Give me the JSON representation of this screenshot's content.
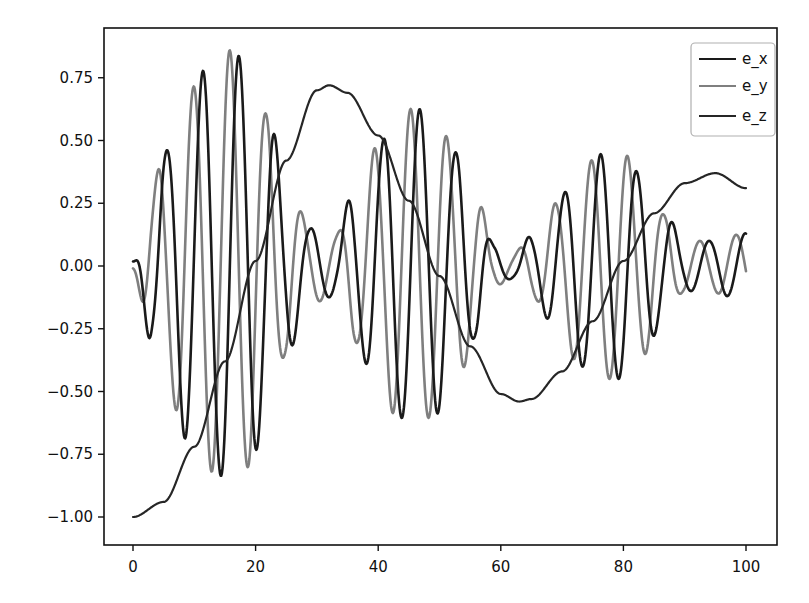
{
  "chart_data": {
    "type": "line",
    "title": "",
    "xlabel": "",
    "ylabel": "",
    "xlim": [
      -5,
      105
    ],
    "ylim": [
      -1.1,
      0.9
    ],
    "x_ticks": [
      0,
      20,
      40,
      60,
      80,
      100
    ],
    "x_tick_labels": [
      "0",
      "20",
      "40",
      "60",
      "80",
      "100"
    ],
    "y_ticks": [
      0.75,
      0.5,
      0.25,
      0.0,
      -0.25,
      -0.5,
      -0.75,
      -1.0
    ],
    "y_tick_labels": [
      "0.75",
      "0.50",
      "0.25",
      "0.00",
      "−0.25",
      "−0.50",
      "−0.75",
      "−1.00"
    ],
    "grid": false,
    "legend_position": "upper right",
    "colors": {
      "e_x": "#1a1a1a",
      "e_y": "#7f7f7f",
      "e_z": "#262626"
    },
    "series": [
      {
        "name": "e_x",
        "description": "fast oscillation (period ~5.9) with modulated envelope",
        "oscillation_period": 5.9,
        "phase_offset": 0.9,
        "envelope": {
          "t": [
            0,
            3,
            5,
            9,
            13,
            16,
            19,
            22,
            25,
            29,
            33,
            36,
            40,
            43,
            46,
            49,
            53,
            56,
            59,
            62,
            65,
            69,
            73,
            77,
            80,
            83,
            87,
            90,
            94,
            97,
            100
          ],
          "a": [
            0.02,
            0.3,
            0.45,
            0.7,
            0.82,
            0.86,
            0.8,
            0.6,
            0.35,
            0.15,
            0.12,
            0.3,
            0.48,
            0.6,
            0.63,
            0.6,
            0.45,
            0.28,
            0.08,
            0.05,
            0.12,
            0.25,
            0.4,
            0.45,
            0.45,
            0.36,
            0.2,
            0.1,
            0.1,
            0.12,
            0.13
          ]
        },
        "key_points": [
          [
            0,
            0.0
          ],
          [
            2,
            -0.17
          ],
          [
            5,
            0.44
          ],
          [
            8,
            -0.66
          ],
          [
            11.5,
            0.8
          ],
          [
            14,
            -0.87
          ],
          [
            17.5,
            0.84
          ],
          [
            20,
            -0.79
          ],
          [
            23.5,
            0.56
          ],
          [
            100,
            -0.12
          ]
        ]
      },
      {
        "name": "e_y",
        "description": "fast oscillation leading e_x by ~quarter period",
        "oscillation_period": 5.9,
        "phase_offset": 0.0,
        "envelope_same_as": "e_x",
        "key_points": [
          [
            0,
            0.0
          ],
          [
            1,
            -0.05
          ],
          [
            4,
            0.31
          ],
          [
            7,
            -0.55
          ],
          [
            10.5,
            0.74
          ],
          [
            13,
            -0.84
          ],
          [
            16,
            0.86
          ],
          [
            19,
            -0.79
          ],
          [
            22,
            0.6
          ],
          [
            100,
            0.14
          ]
        ]
      },
      {
        "name": "e_z",
        "description": "slow oscillation",
        "x": [
          0,
          5,
          10,
          15,
          20,
          25,
          30,
          32,
          35,
          40,
          45,
          50,
          55,
          60,
          63,
          65,
          70,
          75,
          80,
          85,
          90,
          95,
          100
        ],
        "values": [
          -1.0,
          -0.94,
          -0.72,
          -0.38,
          0.02,
          0.42,
          0.7,
          0.72,
          0.69,
          0.52,
          0.26,
          -0.04,
          -0.32,
          -0.51,
          -0.54,
          -0.53,
          -0.42,
          -0.22,
          0.02,
          0.21,
          0.33,
          0.37,
          0.31
        ]
      }
    ]
  },
  "legend": {
    "items": [
      {
        "label": "e_x",
        "color": "#1a1a1a"
      },
      {
        "label": "e_y",
        "color": "#7f7f7f"
      },
      {
        "label": "e_z",
        "color": "#262626"
      }
    ]
  }
}
